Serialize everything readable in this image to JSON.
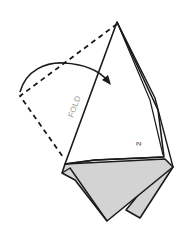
{
  "diagram": {
    "labels": {
      "fold": "FOLD",
      "step_number": "2"
    },
    "colors": {
      "line": "#1a1a1a",
      "paper_back": "#d3d3d3",
      "paper_front": "#ffffff",
      "fold_text": "#9a9a9a",
      "number_text": "#777777",
      "background": "#ffffff"
    },
    "elements": [
      {
        "name": "dashed-flap-outline",
        "type": "dashed-line",
        "description": "Original position of flap before folding"
      },
      {
        "name": "fold-direction-arrow",
        "type": "curved-arrow",
        "description": "Arrow indicating the flap folds over to the right"
      },
      {
        "name": "white-flap",
        "type": "polygon",
        "description": "Folded white kite-shaped flap"
      },
      {
        "name": "gray-base",
        "type": "polygon",
        "description": "Gray underside layers of the paper"
      }
    ]
  }
}
